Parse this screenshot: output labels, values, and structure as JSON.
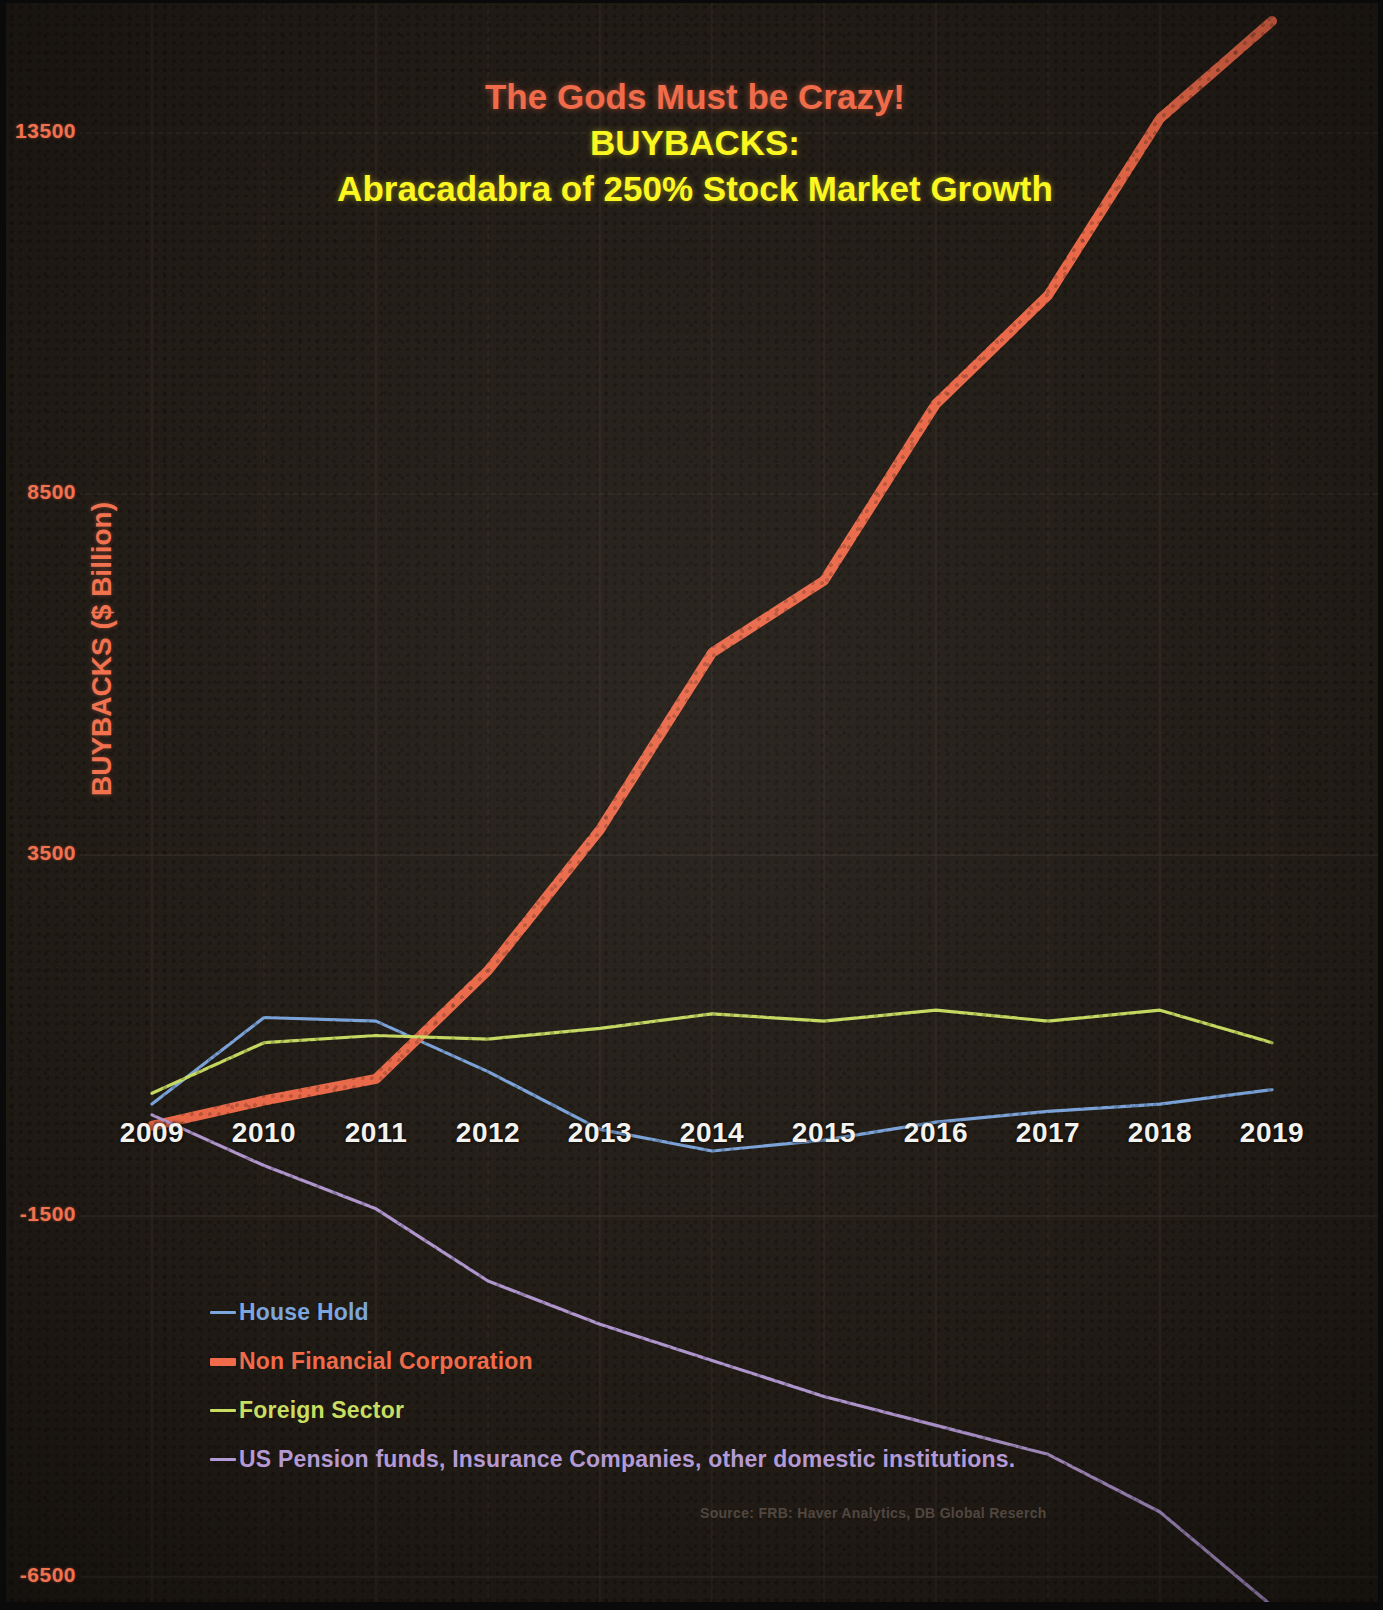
{
  "title": {
    "line1": "The Gods Must be Crazy!",
    "line2": "BUYBACKS:",
    "line3": "Abracadabra of 250% Stock Market Growth",
    "line1_color": "#ef6b4a",
    "line2_color": "#fcf721",
    "line3_color": "#fcf721"
  },
  "axis": {
    "y_title": "BUYBACKS ($ Billion)",
    "y_title_color": "#f2714f",
    "y_ticks": [
      "13500",
      "8500",
      "3500",
      "-1500",
      "-6500"
    ],
    "x_ticks": [
      "2009",
      "2010",
      "2011",
      "2012",
      "2013",
      "2014",
      "2015",
      "2016",
      "2017",
      "2018",
      "2019"
    ]
  },
  "legend": [
    {
      "label": "House Hold",
      "color": "#7ca6de"
    },
    {
      "label": "Non Financial Corporation",
      "color": "#ef6b4a"
    },
    {
      "label": "Foreign Sector",
      "color": "#c9de61"
    },
    {
      "label": "US Pension funds, Insurance Companies, other domestic institutions.",
      "color": "#b49ad4"
    }
  ],
  "source": "Source: FRB: Haver Analytics, DB Global Reserch",
  "background_color": "#221c16",
  "chart_data": {
    "type": "line",
    "title": "The Gods Must be Crazy! BUYBACKS: Abracadabra of 250% Stock Market Growth",
    "xlabel": "",
    "ylabel": "BUYBACKS ($ Billion)",
    "x": [
      2009,
      2010,
      2011,
      2012,
      2013,
      2014,
      2015,
      2016,
      2017,
      2018,
      2019
    ],
    "ylim": [
      -6500,
      15000
    ],
    "xlim": [
      2009,
      2019
    ],
    "yticks": [
      -6500,
      -1500,
      3500,
      8500,
      13500
    ],
    "grid": true,
    "legend_position": "lower-left",
    "series": [
      {
        "name": "House Hold",
        "color": "#7ca6de",
        "values": [
          50,
          1250,
          1200,
          500,
          -300,
          -600,
          -450,
          -200,
          -50,
          50,
          250
        ]
      },
      {
        "name": "Non Financial Corporation",
        "color": "#ef6b4a",
        "values": [
          -250,
          100,
          400,
          1900,
          3850,
          6300,
          7300,
          9750,
          11250,
          13700,
          15050
        ]
      },
      {
        "name": "Foreign Sector",
        "color": "#c9de61",
        "values": [
          200,
          900,
          1000,
          950,
          1100,
          1300,
          1200,
          1350,
          1200,
          1350,
          900
        ]
      },
      {
        "name": "US Pension funds, Insurance Companies, other domestic institutions.",
        "color": "#b49ad4",
        "values": [
          -100,
          -800,
          -1400,
          -2400,
          -3000,
          -3500,
          -4000,
          -4400,
          -4800,
          -5600,
          -6900
        ]
      }
    ]
  }
}
